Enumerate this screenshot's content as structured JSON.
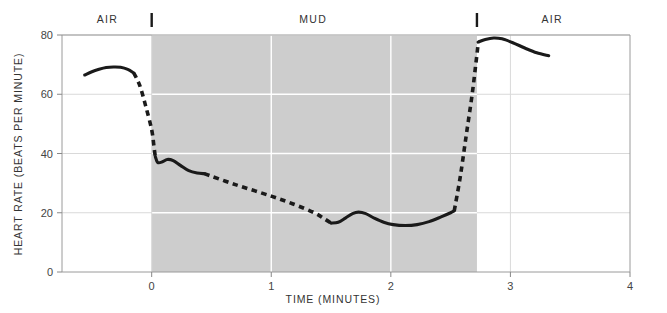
{
  "chart_data": {
    "type": "line",
    "title": "",
    "subtitle": "",
    "xlabel": "TIME  (MINUTES)",
    "ylabel": "HEART RATE (BEATS PER MINUTE)",
    "xlim": [
      -0.75,
      4
    ],
    "ylim": [
      0,
      80
    ],
    "xticks": [
      "0",
      "1",
      "2",
      "3",
      "4"
    ],
    "xtick_values": [
      0,
      1,
      2,
      3,
      4
    ],
    "yticks": [
      "0",
      "20",
      "40",
      "60",
      "80"
    ],
    "ytick_values": [
      0,
      20,
      40,
      60,
      80
    ],
    "grid": true,
    "grid_color": "#ffffff",
    "legend": "none",
    "annotations": [
      {
        "label": "AIR",
        "region": "left",
        "x_center": -0.37
      },
      {
        "label": "MUD",
        "region": "middle",
        "x_center": 1.35
      },
      {
        "label": "AIR",
        "region": "right",
        "x_center": 3.35
      }
    ],
    "shaded_region": {
      "label": "MUD",
      "x_start": 0,
      "x_end": 2.72,
      "color": "#cdcdcd"
    },
    "event_markers": [
      {
        "label": "submersion-start",
        "x": 0
      },
      {
        "label": "submersion-end",
        "x": 2.72
      }
    ],
    "series": [
      {
        "name": "heart rate",
        "segments": [
          {
            "style": "solid",
            "points": [
              [
                -0.56,
                66.5
              ],
              [
                -0.5,
                67.6
              ],
              [
                -0.44,
                68.4
              ],
              [
                -0.38,
                69.0
              ],
              [
                -0.32,
                69.2
              ],
              [
                -0.26,
                69.1
              ],
              [
                -0.2,
                68.4
              ],
              [
                -0.15,
                67.2
              ]
            ]
          },
          {
            "style": "dashed",
            "points": [
              [
                -0.15,
                67.2
              ],
              [
                -0.1,
                63.0
              ],
              [
                -0.05,
                56.0
              ],
              [
                0.0,
                48.0
              ],
              [
                0.02,
                42.0
              ],
              [
                0.03,
                39.0
              ]
            ]
          },
          {
            "style": "solid",
            "points": [
              [
                0.03,
                39.0
              ],
              [
                0.05,
                37.0
              ],
              [
                0.09,
                37.2
              ],
              [
                0.13,
                38.0
              ],
              [
                0.18,
                37.6
              ],
              [
                0.24,
                36.0
              ],
              [
                0.31,
                34.2
              ],
              [
                0.38,
                33.4
              ],
              [
                0.44,
                33.2
              ]
            ]
          },
          {
            "style": "dashed",
            "points": [
              [
                0.44,
                33.2
              ],
              [
                0.7,
                29.5
              ],
              [
                1.0,
                25.6
              ],
              [
                1.2,
                22.7
              ],
              [
                1.36,
                20.0
              ],
              [
                1.45,
                17.8
              ],
              [
                1.5,
                16.5
              ]
            ]
          },
          {
            "style": "solid",
            "points": [
              [
                1.5,
                16.5
              ],
              [
                1.56,
                16.8
              ],
              [
                1.62,
                18.2
              ],
              [
                1.68,
                19.7
              ],
              [
                1.73,
                20.2
              ],
              [
                1.79,
                19.7
              ],
              [
                1.86,
                18.2
              ],
              [
                1.94,
                16.8
              ],
              [
                2.02,
                16.0
              ],
              [
                2.12,
                15.7
              ],
              [
                2.22,
                16.0
              ],
              [
                2.32,
                17.0
              ],
              [
                2.42,
                18.6
              ],
              [
                2.5,
                20.0
              ],
              [
                2.53,
                20.6
              ]
            ]
          },
          {
            "style": "dashed",
            "points": [
              [
                2.53,
                20.6
              ],
              [
                2.58,
                32.0
              ],
              [
                2.63,
                46.0
              ],
              [
                2.68,
                60.0
              ],
              [
                2.71,
                70.0
              ],
              [
                2.73,
                77.0
              ]
            ]
          },
          {
            "style": "solid",
            "points": [
              [
                2.73,
                77.6
              ],
              [
                2.79,
                78.5
              ],
              [
                2.86,
                79.0
              ],
              [
                2.93,
                78.7
              ],
              [
                3.02,
                77.4
              ],
              [
                3.12,
                75.6
              ],
              [
                3.22,
                74.0
              ],
              [
                3.32,
                73.0
              ]
            ]
          }
        ]
      }
    ]
  },
  "figure": {
    "line_color": "#1a1a1a",
    "background": "#ffffff",
    "axis_color": "#888888"
  }
}
